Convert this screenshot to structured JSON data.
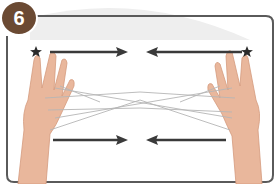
{
  "illustration": {
    "step_number": "6",
    "subject": "cat's cradle string figure, two hands",
    "colors": {
      "badge": "#6b4a33",
      "frame": "#555555",
      "arrow": "#3a3a3a",
      "star": "#2b2b2b",
      "skin": "#e8b59a",
      "string": "#b9b9b9",
      "background_arc": "#ececec"
    },
    "markers": {
      "star_left": "star-icon",
      "star_right": "star-icon"
    },
    "arrows": [
      {
        "position": "top-left",
        "direction": "right"
      },
      {
        "position": "top-right",
        "direction": "left"
      },
      {
        "position": "bottom-left",
        "direction": "right"
      },
      {
        "position": "bottom-right",
        "direction": "left"
      }
    ]
  }
}
